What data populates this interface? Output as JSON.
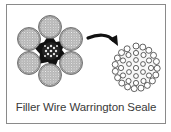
{
  "caption": "Filler Wire Warrington Seale",
  "diagram": {
    "left": {
      "name": "wire-rope-cross-section",
      "strands": 6,
      "core": "independent wire rope core"
    },
    "arrow": {
      "direction": "right-down"
    },
    "right": {
      "name": "strand-cross-section-detail"
    }
  },
  "colors": {
    "frame": "#8a8a8a",
    "ink": "#1a1a1a",
    "text": "#3a3a3a"
  }
}
